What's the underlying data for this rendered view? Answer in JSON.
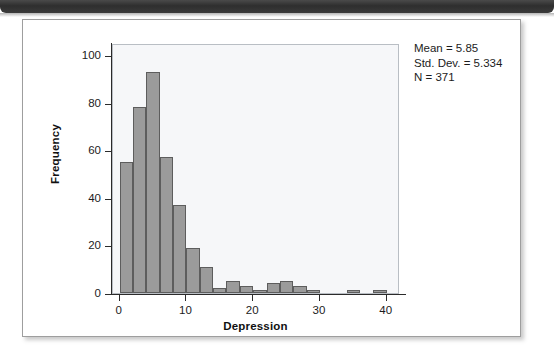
{
  "window": {
    "header_bar": "title-bar"
  },
  "figure": {
    "stats": {
      "mean_label": "Mean = 5.85",
      "sd_label": "Std. Dev. = 5.334",
      "n_label": "N = 371"
    }
  },
  "chart_data": {
    "type": "bar",
    "title": "",
    "subtitle": "",
    "xlabel": "Depression",
    "ylabel": "Frequency",
    "xlim": [
      -1,
      42
    ],
    "ylim": [
      0,
      105
    ],
    "xticks": [
      0,
      10,
      20,
      30,
      40
    ],
    "yticks": [
      0,
      20,
      40,
      60,
      80,
      100
    ],
    "xtick_labels": [
      "0",
      "10",
      "20",
      "30",
      "40"
    ],
    "ytick_labels": [
      "0",
      "20",
      "40",
      "60",
      "80",
      "100"
    ],
    "grid": false,
    "legend": null,
    "bin_width": 2,
    "bar_color": "#9b9b9b",
    "bar_edge_color": "#5d5d5d",
    "panel_color": "#f6f7f9",
    "annotations": [
      "Mean = 5.85",
      "Std. Dev. = 5.334",
      "N = 371"
    ],
    "statistics": {
      "mean": 5.85,
      "std_dev": 5.334,
      "n": 371
    },
    "bins": [
      {
        "x0": 0,
        "x1": 2,
        "value": 55
      },
      {
        "x0": 2,
        "x1": 4,
        "value": 78
      },
      {
        "x0": 4,
        "x1": 6,
        "value": 93
      },
      {
        "x0": 6,
        "x1": 8,
        "value": 57
      },
      {
        "x0": 8,
        "x1": 10,
        "value": 37
      },
      {
        "x0": 10,
        "x1": 12,
        "value": 19
      },
      {
        "x0": 12,
        "x1": 14,
        "value": 11
      },
      {
        "x0": 14,
        "x1": 16,
        "value": 2
      },
      {
        "x0": 16,
        "x1": 18,
        "value": 5
      },
      {
        "x0": 18,
        "x1": 20,
        "value": 3
      },
      {
        "x0": 20,
        "x1": 22,
        "value": 1
      },
      {
        "x0": 22,
        "x1": 24,
        "value": 4
      },
      {
        "x0": 24,
        "x1": 26,
        "value": 5
      },
      {
        "x0": 26,
        "x1": 28,
        "value": 3
      },
      {
        "x0": 28,
        "x1": 30,
        "value": 1
      },
      {
        "x0": 34,
        "x1": 36,
        "value": 1
      },
      {
        "x0": 38,
        "x1": 40,
        "value": 1
      }
    ],
    "categories": [
      "0-2",
      "2-4",
      "4-6",
      "6-8",
      "8-10",
      "10-12",
      "12-14",
      "14-16",
      "16-18",
      "18-20",
      "20-22",
      "22-24",
      "24-26",
      "26-28",
      "28-30",
      "34-36",
      "38-40"
    ],
    "values": [
      55,
      78,
      93,
      57,
      37,
      19,
      11,
      2,
      5,
      3,
      1,
      4,
      5,
      3,
      1,
      1,
      1
    ]
  }
}
